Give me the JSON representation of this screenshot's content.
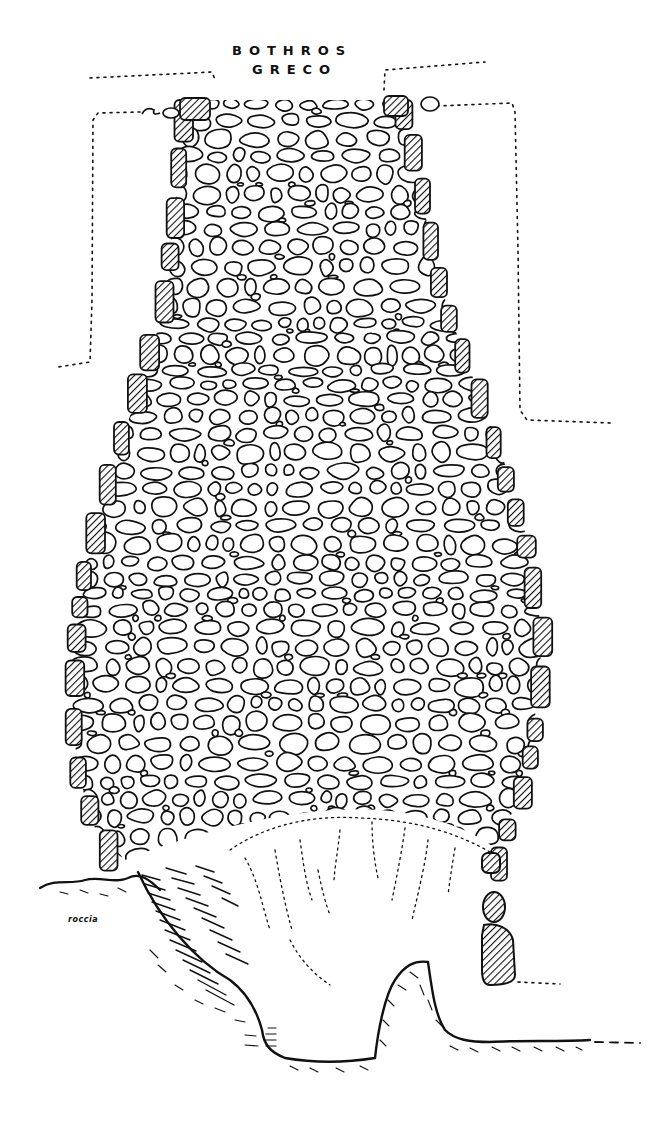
{
  "figure": {
    "type": "archaeological section drawing",
    "title_lines": [
      "BOTHROS",
      "GRECO"
    ],
    "labels": {
      "rock": "roccia"
    },
    "colors": {
      "ink": "#111111",
      "paper": "#ffffff"
    },
    "elements": [
      {
        "name": "stone-fill",
        "description": "flask-shaped pit filled with rounded stones"
      },
      {
        "name": "hatched-wall-blocks",
        "description": "diagonally hatched blocks lining the pit walls"
      },
      {
        "name": "dotted-outlines",
        "description": "dotted outlines of surrounding structures at the top left and top right"
      },
      {
        "name": "cave-cavity",
        "description": "dotted cavity below the stone fill"
      },
      {
        "name": "rock-profile",
        "description": "hatched bedrock profile with a rock spur at the bottom"
      },
      {
        "name": "human-figure-scale",
        "description": "hatched human silhouette for scale at the right"
      }
    ]
  }
}
